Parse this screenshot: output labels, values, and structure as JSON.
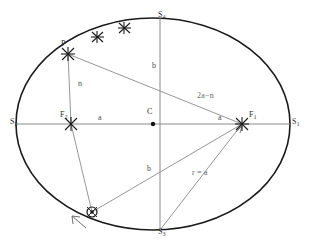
{
  "figure": {
    "background_color": "#ffffff",
    "ink_color": "#1a1a1a",
    "thin_line_color": "#8a8a8a",
    "label_color": "#2b2b2b"
  },
  "labels": {
    "vertex_left": {
      "text": "S",
      "sub": "2",
      "x": 10,
      "y": 118
    },
    "vertex_right": {
      "text": "S",
      "sub": "1",
      "x": 292,
      "y": 118
    },
    "vertex_top": {
      "text": "S",
      "sub": "4",
      "x": 158,
      "y": 11
    },
    "vertex_bottom": {
      "text": "S",
      "sub": "3",
      "x": 158,
      "y": 228
    },
    "point_p": {
      "text": "P",
      "x": 61,
      "y": 42
    },
    "focus_left": {
      "text": "F",
      "sub": "2",
      "x": 60,
      "y": 113
    },
    "focus_right": {
      "text": "F",
      "sub": "1",
      "x": 249,
      "y": 113
    },
    "center": {
      "text": "C",
      "x": 147,
      "y": 110
    },
    "semi_major_left": {
      "text": "a",
      "x": 98,
      "y": 115
    },
    "semi_major_right": {
      "text": "a",
      "x": 218,
      "y": 115
    },
    "semi_minor_top": {
      "text": "b",
      "x": 152,
      "y": 64
    },
    "semi_minor_bottom": {
      "text": "b",
      "x": 147,
      "y": 167
    },
    "radius_n": {
      "text": "n",
      "x": 78,
      "y": 82
    },
    "radius_2a_minus_n": {
      "text": "2a−n",
      "x": 197,
      "y": 94
    },
    "radius_r_equals_a": {
      "text": "r = a",
      "x": 192,
      "y": 171
    }
  },
  "geometry": {
    "ellipse": {
      "cx": 153,
      "cy": 124,
      "rx": 137,
      "ry": 106
    },
    "center_point": {
      "x": 153,
      "y": 124
    },
    "focus_left_point": {
      "x": 71,
      "y": 124
    },
    "focus_right_point": {
      "x": 242,
      "y": 124
    },
    "point_p": {
      "x": 68,
      "y": 54
    },
    "bottom_body": {
      "x": 92,
      "y": 212
    },
    "vertex_top_point": {
      "x": 160,
      "y": 18
    },
    "vertex_bottom_point": {
      "x": 160,
      "y": 230
    },
    "star_markers": [
      {
        "x": 97,
        "y": 37
      },
      {
        "x": 124,
        "y": 28
      }
    ],
    "direction_arrow": {
      "from_x": 84,
      "from_y": 226,
      "to_x": 72,
      "to_y": 216
    }
  },
  "markers": {
    "star_icon": "star-cross-marker",
    "body_icon": "circled-body-marker",
    "arrow_icon": "motion-direction-arrow",
    "dot_icon": "center-dot"
  }
}
